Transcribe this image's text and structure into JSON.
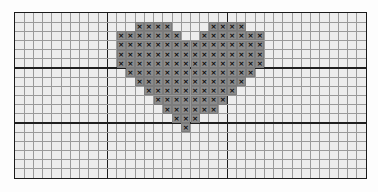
{
  "chart_data": {
    "type": "heatmap",
    "title": "",
    "subtitle": "",
    "xlabel": "",
    "ylabel": "",
    "grid": {
      "columns": 38,
      "rows": 18,
      "cell_px": 9.25,
      "heavy_every": 10,
      "heavy_column_lines": [
        10,
        23
      ],
      "heavy_row_lines": [
        6,
        12
      ],
      "grid_on": true,
      "legend_position": "none"
    },
    "symbol": "×",
    "symbol_label": "x",
    "colors": {
      "background": "#ededed",
      "gridline": "#9a9a9a",
      "gridline_heavy": "#1f1f1f",
      "border": "#1a1a1a",
      "filled_cell": "#8c8c8c",
      "symbol": "#0d0d0d",
      "page": "#fdfdfd"
    },
    "stitch_count": 155,
    "filled_rows": [
      {
        "row": 1,
        "cols": [
          13,
          14,
          15,
          16,
          21,
          22,
          23,
          24
        ]
      },
      {
        "row": 2,
        "cols": [
          11,
          12,
          13,
          14,
          15,
          16,
          17,
          20,
          21,
          22,
          23,
          24,
          25,
          26
        ]
      },
      {
        "row": 3,
        "cols": [
          11,
          12,
          13,
          14,
          15,
          16,
          17,
          18,
          19,
          20,
          21,
          22,
          23,
          24,
          25,
          26
        ]
      },
      {
        "row": 4,
        "cols": [
          11,
          12,
          13,
          14,
          15,
          16,
          17,
          18,
          19,
          20,
          21,
          22,
          23,
          24,
          25,
          26
        ]
      },
      {
        "row": 5,
        "cols": [
          11,
          12,
          13,
          14,
          15,
          16,
          17,
          18,
          19,
          20,
          21,
          22,
          23,
          24,
          25,
          26
        ]
      },
      {
        "row": 6,
        "cols": [
          12,
          13,
          14,
          15,
          16,
          17,
          18,
          19,
          20,
          21,
          22,
          23,
          24,
          25
        ]
      },
      {
        "row": 7,
        "cols": [
          13,
          14,
          15,
          16,
          17,
          18,
          19,
          20,
          21,
          22,
          23,
          24
        ]
      },
      {
        "row": 8,
        "cols": [
          14,
          15,
          16,
          17,
          18,
          19,
          20,
          21,
          22,
          23
        ]
      },
      {
        "row": 9,
        "cols": [
          15,
          16,
          17,
          18,
          19,
          20,
          21,
          22
        ]
      },
      {
        "row": 10,
        "cols": [
          16,
          17,
          18,
          19,
          20,
          21
        ]
      },
      {
        "row": 11,
        "cols": [
          17,
          18,
          19
        ]
      },
      {
        "row": 12,
        "cols": [
          18
        ]
      }
    ]
  },
  "chart": {
    "name_label": "cross-stitch-pattern-chart"
  }
}
